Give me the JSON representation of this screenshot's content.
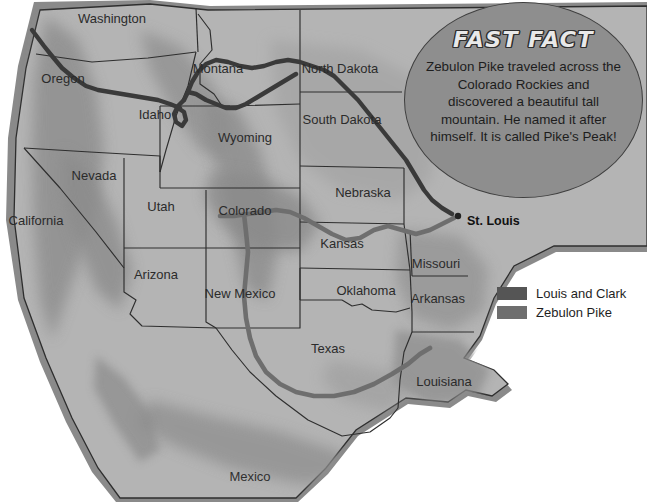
{
  "map": {
    "title": "Lewis and Clark and Zebulon Pike Expedition Routes Map",
    "colors": {
      "ocean": "#ffffff",
      "land": "#b3b3b3",
      "land_light": "#bdbdbd",
      "coastal_shade": "#8d8d8d",
      "mountain_shade": "#8f8f8f",
      "border": "#2e2e2e",
      "route_lewis_clark": "#3a3a3a",
      "route_pike": "#6e6e6e",
      "bubble_fill": "#8e8e8e",
      "bubble_stroke": "#3f3f3f"
    },
    "states": [
      {
        "name": "Washington",
        "x": 112,
        "y": 20
      },
      {
        "name": "Oregon",
        "x": 63,
        "y": 80
      },
      {
        "name": "Idaho",
        "x": 155,
        "y": 116
      },
      {
        "name": "Montana",
        "x": 218,
        "y": 70
      },
      {
        "name": "North Dakota",
        "x": 340,
        "y": 70
      },
      {
        "name": "South Dakota",
        "x": 342,
        "y": 121
      },
      {
        "name": "Wyoming",
        "x": 245,
        "y": 139
      },
      {
        "name": "Nebraska",
        "x": 363,
        "y": 194
      },
      {
        "name": "Nevada",
        "x": 94,
        "y": 177
      },
      {
        "name": "Utah",
        "x": 161,
        "y": 208
      },
      {
        "name": "California",
        "x": 36,
        "y": 222
      },
      {
        "name": "Colorado",
        "x": 245,
        "y": 212
      },
      {
        "name": "Kansas",
        "x": 342,
        "y": 245
      },
      {
        "name": "Missouri",
        "x": 436,
        "y": 265
      },
      {
        "name": "Arizona",
        "x": 156,
        "y": 276
      },
      {
        "name": "New Mexico",
        "x": 240,
        "y": 295
      },
      {
        "name": "Oklahoma",
        "x": 366,
        "y": 292
      },
      {
        "name": "Arkansas",
        "x": 438,
        "y": 300
      },
      {
        "name": "Texas",
        "x": 328,
        "y": 350
      },
      {
        "name": "Louisiana",
        "x": 444,
        "y": 383
      }
    ],
    "countries": [
      {
        "name": "Mexico",
        "x": 250,
        "y": 478
      }
    ],
    "cities": [
      {
        "name": "St. Louis",
        "x": 467,
        "y": 222,
        "dot_x": 458,
        "dot_y": 216
      }
    ]
  },
  "fast_fact": {
    "title": "FAST FACT",
    "body": "Zebulon Pike traveled across the Colorado Rockies and discovered a beautiful tall mountain. He named it after himself. It is called Pike's Peak!"
  },
  "legend": {
    "items": [
      {
        "label": "Louis and Clark",
        "color": "#555555"
      },
      {
        "label": "Zebulon Pike",
        "color": "#6e6e6e"
      }
    ]
  }
}
